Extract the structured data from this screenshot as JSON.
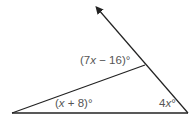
{
  "diagram": {
    "type": "triangle-exterior-angle",
    "colors": {
      "stroke": "#222222",
      "label": "#555555",
      "background": "#ffffff"
    },
    "vertices": {
      "bottom_left": [
        12,
        113
      ],
      "bottom_right": [
        188,
        113
      ],
      "top": [
        145,
        65
      ],
      "ray_tip": [
        97,
        8
      ]
    },
    "labels": {
      "exterior_angle": {
        "prefix": "(7",
        "var": "x",
        "suffix": " − 16)°"
      },
      "left_angle": {
        "prefix": "(",
        "var": "x",
        "suffix": " + 8)°"
      },
      "right_angle": {
        "prefix": "4",
        "var": "x",
        "suffix": "°"
      }
    }
  }
}
